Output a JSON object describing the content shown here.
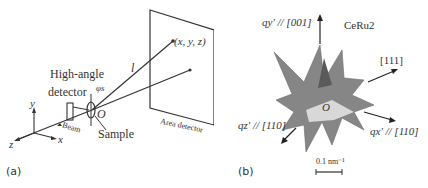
{
  "panel_a": {
    "label": "(a)",
    "labels": {
      "high_angle": "High-angle",
      "detector": "detector",
      "phi": "φs",
      "coord": "(x, y, z)",
      "l": "l",
      "origin": "O",
      "sample": "Sample",
      "beam": "Beam",
      "area_detector": "Area detector",
      "axis_x": "x",
      "axis_y": "y",
      "axis_z": "z"
    }
  },
  "panel_b": {
    "label": "(b)",
    "labels": {
      "qy": "qy' // [001]",
      "material": "CeRu2",
      "dir111": "[111]",
      "origin": "O",
      "qz": "qz' // [110]",
      "qx": "qx' // [110]",
      "scale": "0.1 nm⁻¹"
    }
  },
  "colors": {
    "line": "#333333",
    "shape_dark": "#6e6e6e",
    "shape_light": "#c9c9c9"
  }
}
